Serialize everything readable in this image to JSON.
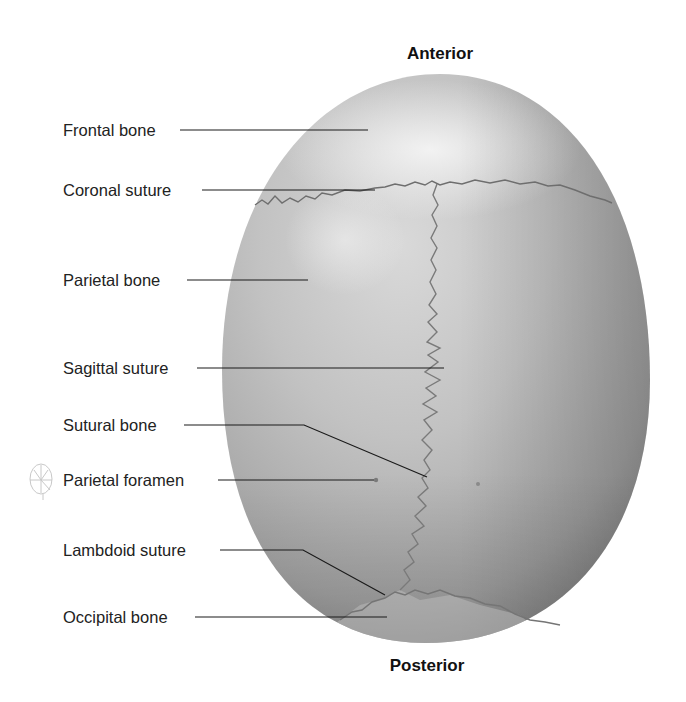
{
  "diagram": {
    "orientation": {
      "top": "Anterior",
      "bottom": "Posterior"
    },
    "labels": [
      {
        "text": "Frontal bone",
        "x": 63,
        "y": 150
      },
      {
        "text": "Coronal suture",
        "x": 63,
        "y": 182
      },
      {
        "text": "Parietal bone",
        "x": 63,
        "y": 272
      },
      {
        "text": "Sagittal suture",
        "x": 63,
        "y": 360
      },
      {
        "text": "Sutural bone",
        "x": 63,
        "y": 416
      },
      {
        "text": "Parietal foramen",
        "x": 63,
        "y": 472
      },
      {
        "text": "Lambdoid suture",
        "x": 63,
        "y": 541
      },
      {
        "text": "Occipital bone",
        "x": 63,
        "y": 607
      }
    ],
    "icons": {
      "skull_thumbnail": "skull-orientation-thumbnail-icon"
    },
    "colors": {
      "skull_light": "#e6e6e6",
      "skull_mid": "#b4b4b4",
      "skull_dark": "#8c8c8c",
      "suture": "#6b6b6b",
      "leader_line": "#1a1a1a",
      "text": "#222222"
    }
  }
}
